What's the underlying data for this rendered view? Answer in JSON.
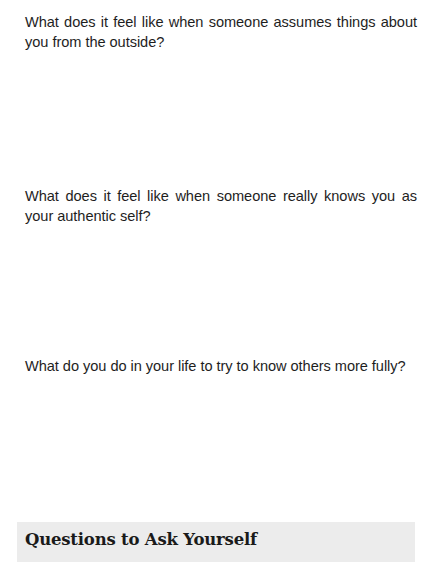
{
  "questions": [
    {
      "text": "What does it feel like when someone assumes things about you from the outside?"
    },
    {
      "text": "What does it feel like when someone really knows you as your authentic self?"
    },
    {
      "text": "What do you do in your life to try to know others more fully?"
    }
  ],
  "section": {
    "heading": "Questions to Ask Yourself",
    "background_color": "#ececec"
  }
}
